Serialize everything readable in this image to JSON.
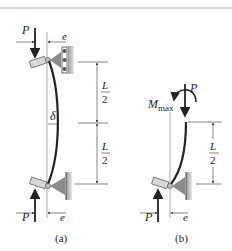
{
  "figure": {
    "colors": {
      "line": "#222222",
      "thin": "#555555",
      "support": "#8a8a8a",
      "pin": "#c8c8c8",
      "rule": "#b0b0b0"
    },
    "panel_a": {
      "caption": "(a)",
      "load_top": "P",
      "load_bottom": "P",
      "eccentricity_top": "e",
      "eccentricity_bottom": "e",
      "deflection": "δ",
      "dim_upper_num": "L",
      "dim_upper_den": "2",
      "dim_lower_num": "L",
      "dim_lower_den": "2"
    },
    "panel_b": {
      "caption": "(b)",
      "load_top": "P",
      "load_bottom": "P",
      "moment": "M",
      "moment_sub": "max",
      "eccentricity": "e",
      "dim_num": "L",
      "dim_den": "2"
    }
  }
}
